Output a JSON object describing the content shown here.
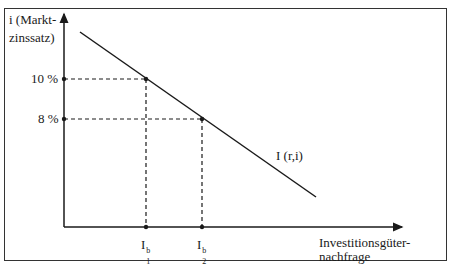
{
  "diagram": {
    "y_axis_label_line1": "i (Markt-",
    "y_axis_label_line2": "zinssatz)",
    "x_axis_label_line1": "Investitionsgüter-",
    "x_axis_label_line2": "nachfrage",
    "curve_label": "I (r,i)",
    "y_ticks": [
      {
        "label": "10 %",
        "value": 10
      },
      {
        "label": "8 %",
        "value": 8
      }
    ],
    "x_ticks": [
      {
        "base": "I",
        "sup": "b",
        "sub": "1"
      },
      {
        "base": "I",
        "sup": "b",
        "sub": "2"
      }
    ],
    "line_color": "#1a1a1a"
  }
}
